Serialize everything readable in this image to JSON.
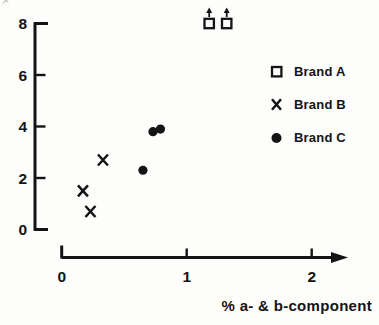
{
  "chart_data": {
    "type": "scatter",
    "title": "",
    "xlabel": "% a- & b-component",
    "ylabel": "",
    "xlim": [
      0,
      2.3
    ],
    "ylim": [
      0,
      8
    ],
    "x_ticks": [
      0,
      1,
      2
    ],
    "y_ticks": [
      0,
      2,
      4,
      6,
      8
    ],
    "grid": false,
    "legend_position": "upper-right",
    "axis_style": "detached-axes-with-x-arrow",
    "off_scale_marker": "up-arrow",
    "colors": {
      "ink": "#141414",
      "background": "#fdfdfb"
    },
    "series": [
      {
        "name": "Brand A",
        "marker": "open-square",
        "points": [
          {
            "x": 1.18,
            "y": 8,
            "off_scale": true
          },
          {
            "x": 1.32,
            "y": 8,
            "off_scale": true
          }
        ]
      },
      {
        "name": "Brand B",
        "marker": "x-cross",
        "points": [
          {
            "x": 0.17,
            "y": 1.5
          },
          {
            "x": 0.23,
            "y": 0.7
          },
          {
            "x": 0.33,
            "y": 2.7
          }
        ]
      },
      {
        "name": "Brand C",
        "marker": "filled-circle",
        "points": [
          {
            "x": 0.65,
            "y": 2.3
          },
          {
            "x": 0.73,
            "y": 3.8
          },
          {
            "x": 0.79,
            "y": 3.9
          }
        ]
      }
    ]
  }
}
